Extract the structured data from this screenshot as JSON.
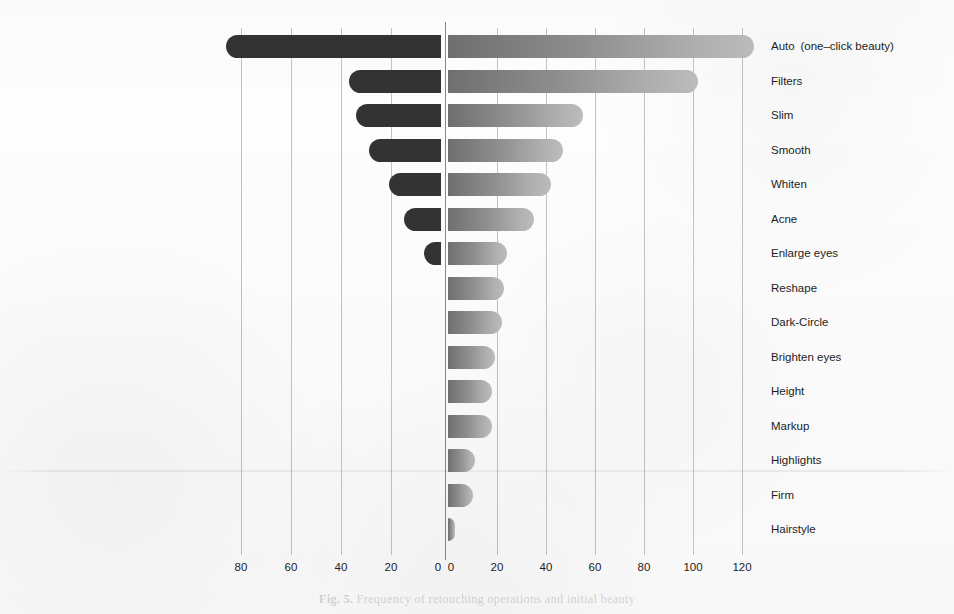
{
  "chart_data": {
    "type": "bar",
    "title": "",
    "subtitle": "",
    "orientation": "horizontal",
    "layout": "diverging-paired-bars",
    "grid": true,
    "legend_position": "none",
    "xlabel": "",
    "ylabel": "",
    "left_panel": {
      "name": "Left panel",
      "axis_direction": "right-to-left",
      "xlim": [
        0,
        90
      ],
      "tick_labels": [
        "80",
        "60",
        "40",
        "20",
        "0"
      ],
      "tick_values": [
        80,
        60,
        40,
        20,
        0
      ],
      "categories": [
        "Auto (one–click beauty)",
        "Whiten",
        "Manually adjust the beauty level",
        "Filters",
        "Smooth",
        "Enlarge eyes",
        "Slim"
      ],
      "values": [
        86,
        37,
        34,
        29,
        21,
        15,
        7
      ]
    },
    "right_panel": {
      "name": "Right panel",
      "axis_direction": "left-to-right",
      "xlim": [
        0,
        128
      ],
      "tick_labels": [
        "0",
        "20",
        "40",
        "60",
        "80",
        "100",
        "120"
      ],
      "tick_values": [
        0,
        20,
        40,
        60,
        80,
        100,
        120
      ],
      "categories": [
        "Auto (one–click beauty)",
        "Filters",
        "Slim",
        "Smooth",
        "Whiten",
        "Acne",
        "Enlarge eyes",
        "Reshape",
        "Dark-Circle",
        "Brighten eyes",
        "Height",
        "Markup",
        "Highlights",
        "Firm",
        "Hairstyle"
      ],
      "values": [
        125,
        102,
        55,
        47,
        42,
        35,
        24,
        23,
        22,
        19,
        18,
        18,
        11,
        10,
        3
      ]
    },
    "colors": {
      "left_bar": "#333333",
      "right_bar_start": "#6f6f6f",
      "right_bar_end": "#bcbcbc",
      "gridline": "#3c3c3c",
      "axis": "#282828",
      "background": "#fdfdfd",
      "text": "#1d1d1d"
    }
  },
  "caption": {
    "label": "Fig. 5.",
    "text": "Frequency of retouching operations and initial beauty"
  }
}
